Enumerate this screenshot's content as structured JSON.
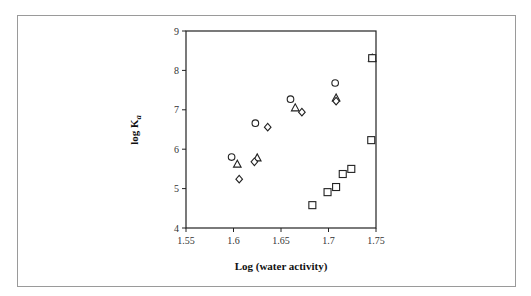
{
  "chart_data": {
    "type": "scatter",
    "title": "",
    "xlabel": "Log (water activity)",
    "ylabel": "log K",
    "ylabel_subscript": "a",
    "xlim": [
      1.55,
      1.75
    ],
    "ylim": [
      4,
      9
    ],
    "xticks": [
      "1.55",
      "1.6",
      "1.65",
      "1.7",
      "1.75"
    ],
    "yticks": [
      "4",
      "5",
      "6",
      "7",
      "8",
      "9"
    ],
    "grid": false,
    "legend": null,
    "series": [
      {
        "name": "circle",
        "marker": "circle",
        "points": [
          [
            1.598,
            5.8
          ],
          [
            1.623,
            6.66
          ],
          [
            1.66,
            7.27
          ],
          [
            1.707,
            7.68
          ],
          [
            1.746,
            8.31
          ]
        ]
      },
      {
        "name": "triangle",
        "marker": "triangle",
        "points": [
          [
            1.604,
            5.62
          ],
          [
            1.625,
            5.78
          ],
          [
            1.665,
            7.05
          ],
          [
            1.708,
            7.3
          ],
          [
            1.746,
            8.31
          ]
        ]
      },
      {
        "name": "diamond",
        "marker": "diamond",
        "points": [
          [
            1.606,
            5.24
          ],
          [
            1.622,
            5.68
          ],
          [
            1.636,
            6.56
          ],
          [
            1.672,
            6.94
          ],
          [
            1.708,
            7.22
          ]
        ]
      },
      {
        "name": "square",
        "marker": "square",
        "points": [
          [
            1.683,
            4.58
          ],
          [
            1.699,
            4.91
          ],
          [
            1.708,
            5.04
          ],
          [
            1.715,
            5.37
          ],
          [
            1.724,
            5.5
          ],
          [
            1.745,
            6.23
          ],
          [
            1.746,
            8.31
          ]
        ]
      }
    ]
  }
}
